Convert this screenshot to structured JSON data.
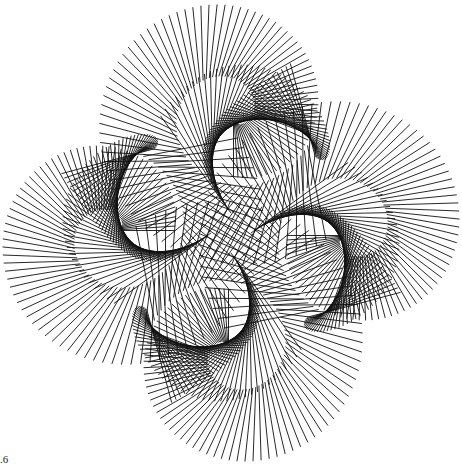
{
  "figure": {
    "background": "#ffffff",
    "stroke_color": "#111111",
    "center": [
      231,
      233
    ],
    "arms": 4,
    "segments_per_arm": 150,
    "arm_spiral_center_offset": [
      0,
      -118
    ],
    "segment_length": 120,
    "corner_label": ".6"
  }
}
